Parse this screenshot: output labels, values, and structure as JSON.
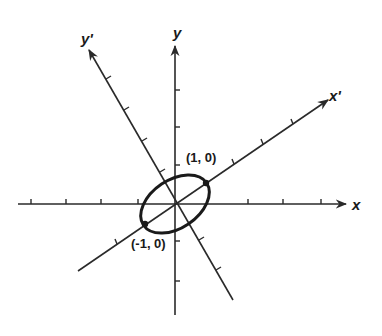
{
  "figure": {
    "axes": {
      "x_label": "x",
      "y_label": "y",
      "x_prime_label": "x'",
      "y_prime_label": "y'"
    },
    "points": [
      {
        "label": "(1, 0)",
        "frame": "x'y'"
      },
      {
        "label": "(-1, 0)",
        "frame": "x'y'"
      }
    ],
    "colors": {
      "ink": "#1a1a1a",
      "background": "#ffffff"
    }
  }
}
